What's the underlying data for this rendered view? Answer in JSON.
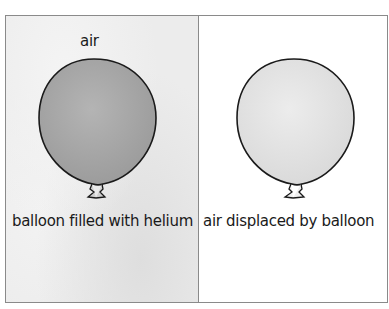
{
  "diagram": {
    "left_panel": {
      "top_label": "air",
      "caption": "balloon filled with helium",
      "balloon_fill": "#a8a8a8"
    },
    "right_panel": {
      "caption": "air displaced by balloon",
      "balloon_fill": "#e4e4e4"
    }
  }
}
